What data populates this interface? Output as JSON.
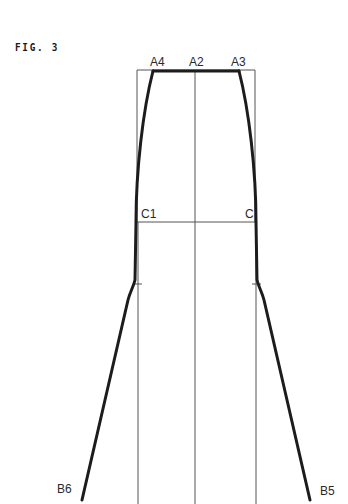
{
  "figure": {
    "title": "FIG. 3"
  },
  "labels": {
    "a4": "A4",
    "a2": "A2",
    "a3": "A3",
    "c1": "C1",
    "c": "C",
    "b6": "B6",
    "b5": "B5"
  },
  "colors": {
    "outline": "#1c1c1c",
    "construction": "#555555",
    "background": "#ffffff"
  }
}
